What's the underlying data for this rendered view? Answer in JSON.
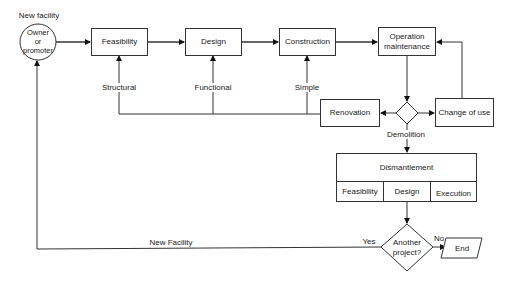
{
  "diagram": {
    "start": {
      "label_above": "New facility",
      "circle_label": "Owner\nor\npromoter"
    },
    "stages": [
      {
        "id": "feasibility",
        "label": "Feasibility"
      },
      {
        "id": "design",
        "label": "Design"
      },
      {
        "id": "construction",
        "label": "Construction"
      },
      {
        "id": "operation",
        "label": "Operation\nmaintenance"
      }
    ],
    "renovation": {
      "label": "Renovation"
    },
    "change_of_use": {
      "label": "Change of use"
    },
    "renovation_paths": [
      {
        "label": "Structural",
        "target": "Feasibility"
      },
      {
        "label": "Functional",
        "target": "Design"
      },
      {
        "label": "Simple",
        "target": "Construction"
      }
    ],
    "demolition_label": "Demolition",
    "dismantlement": {
      "title": "Dismantlement",
      "phases": [
        "Feasibility",
        "Design",
        "Execution"
      ]
    },
    "decision": {
      "label": "Another\nproject?",
      "yes": "Yes",
      "no": "No"
    },
    "end": {
      "label": "End"
    },
    "loop_label": "New Facility"
  }
}
